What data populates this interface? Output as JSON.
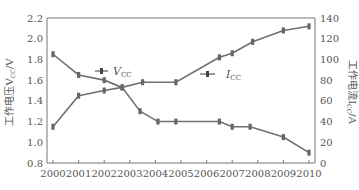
{
  "chart_data": {
    "type": "line",
    "title": "",
    "xlabel": "",
    "ylabel_left": "工作电压V_CC/V",
    "ylabel_right": "工作电流I_CC/A",
    "x_ticks": [
      "2000",
      "2001",
      "2002",
      "2003",
      "2004",
      "2005",
      "2006",
      "2007",
      "2008",
      "2009",
      "2010"
    ],
    "ylim_left": [
      0.8,
      2.2
    ],
    "y_ticks_left": [
      "0.8",
      "1.0",
      "1.2",
      "1.4",
      "1.6",
      "1.8",
      "2.0",
      "2.2"
    ],
    "ylim_right": [
      0,
      140
    ],
    "y_ticks_right": [
      "0",
      "20",
      "40",
      "60",
      "80",
      "100",
      "120",
      "140"
    ],
    "grid": false,
    "series": [
      {
        "name": "V_CC",
        "axis": "left",
        "x": [
          2000,
          2001,
          2002,
          2002.7,
          2003.4,
          2004.1,
          2004.8,
          2006.5,
          2007,
          2007.7,
          2009,
          2010
        ],
        "values": [
          1.85,
          1.65,
          1.6,
          1.53,
          1.3,
          1.2,
          1.2,
          1.2,
          1.15,
          1.15,
          1.05,
          0.9
        ]
      },
      {
        "name": "I_CC",
        "axis": "right",
        "x": [
          2000,
          2001,
          2002,
          2002.7,
          2003.5,
          2004.8,
          2006.5,
          2007,
          2007.8,
          2009,
          2010
        ],
        "values": [
          35,
          65,
          70,
          73,
          78,
          78,
          102,
          106,
          117,
          128,
          132
        ]
      }
    ],
    "annotations": [
      {
        "text": "V_CC",
        "series": "V_CC"
      },
      {
        "text": "I_CC",
        "series": "I_CC"
      }
    ]
  }
}
